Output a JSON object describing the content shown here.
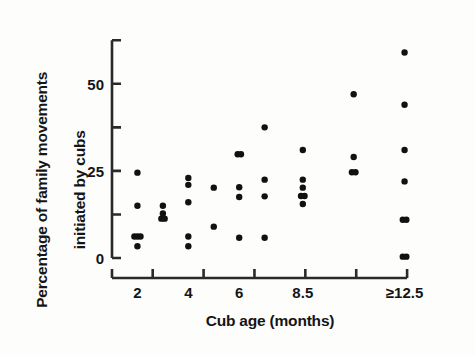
{
  "chart": {
    "type": "scatter",
    "title": "",
    "xlabel": "Cub age (months)",
    "ylabel": "Percentage of family movements\ninitiated by cubs",
    "ylabel_line1": "Percentage of family movements",
    "ylabel_line2": "initiated by cubs",
    "xlim": [
      1.0,
      13.5
    ],
    "ylim": [
      -2,
      62
    ],
    "y_ticks_major": [
      0,
      25,
      50
    ],
    "y_ticks_minor": [
      12.5,
      37.5,
      62.5
    ],
    "y_tick_labels": [
      "0",
      "25",
      "50"
    ],
    "x_tick_labels": [
      "2",
      "4",
      "6",
      "8.5",
      "≥12.5"
    ],
    "x_tick_label_positions": [
      2,
      4,
      6,
      8.5,
      12.5
    ],
    "x_axis_tick_positions": [
      1.0,
      2.6,
      4.6,
      6.6,
      8.6,
      10.6,
      12.6
    ],
    "grid": false,
    "legend": null,
    "marker": "filled-circle",
    "marker_color": "#111111"
  },
  "chart_data": {
    "type": "scatter",
    "title": "",
    "xlabel": "Cub age (months)",
    "ylabel": "Percentage of family movements initiated by cubs",
    "xlim": [
      1.0,
      13.5
    ],
    "ylim": [
      -2,
      62
    ],
    "grid": false,
    "legend": null,
    "x_tick_labels": [
      "2",
      "4",
      "6",
      "8.5",
      "≥12.5"
    ],
    "y_tick_labels": [
      "0",
      "25",
      "50"
    ],
    "points": [
      {
        "x": 2,
        "y": 24.5
      },
      {
        "x": 2,
        "y": 15.0
      },
      {
        "x": 1.88,
        "y": 6.2
      },
      {
        "x": 2.0,
        "y": 6.2
      },
      {
        "x": 2.12,
        "y": 6.2
      },
      {
        "x": 2,
        "y": 3.4
      },
      {
        "x": 3,
        "y": 15.0
      },
      {
        "x": 3,
        "y": 12.8
      },
      {
        "x": 2.94,
        "y": 11.3
      },
      {
        "x": 3.07,
        "y": 11.3
      },
      {
        "x": 4,
        "y": 23.0
      },
      {
        "x": 4,
        "y": 21.0
      },
      {
        "x": 4,
        "y": 16.0
      },
      {
        "x": 4,
        "y": 6.2
      },
      {
        "x": 4,
        "y": 3.4
      },
      {
        "x": 5,
        "y": 20.2
      },
      {
        "x": 5,
        "y": 9.0
      },
      {
        "x": 5.94,
        "y": 29.8
      },
      {
        "x": 6.07,
        "y": 29.8
      },
      {
        "x": 6,
        "y": 20.3
      },
      {
        "x": 6,
        "y": 17.5
      },
      {
        "x": 6,
        "y": 5.8
      },
      {
        "x": 7,
        "y": 37.5
      },
      {
        "x": 7,
        "y": 22.5
      },
      {
        "x": 7,
        "y": 17.7
      },
      {
        "x": 7,
        "y": 5.8
      },
      {
        "x": 8.5,
        "y": 31.0
      },
      {
        "x": 8.5,
        "y": 22.5
      },
      {
        "x": 8.5,
        "y": 20.2
      },
      {
        "x": 8.43,
        "y": 17.8
      },
      {
        "x": 8.57,
        "y": 17.8
      },
      {
        "x": 8.5,
        "y": 15.5
      },
      {
        "x": 10.5,
        "y": 47.0
      },
      {
        "x": 10.5,
        "y": 29.0
      },
      {
        "x": 10.43,
        "y": 24.6
      },
      {
        "x": 10.57,
        "y": 24.6
      },
      {
        "x": 12.5,
        "y": 59.0
      },
      {
        "x": 12.5,
        "y": 44.0
      },
      {
        "x": 12.5,
        "y": 31.0
      },
      {
        "x": 12.5,
        "y": 22.0
      },
      {
        "x": 12.43,
        "y": 11.0
      },
      {
        "x": 12.57,
        "y": 11.0
      },
      {
        "x": 12.43,
        "y": 0.4
      },
      {
        "x": 12.57,
        "y": 0.4
      }
    ]
  }
}
